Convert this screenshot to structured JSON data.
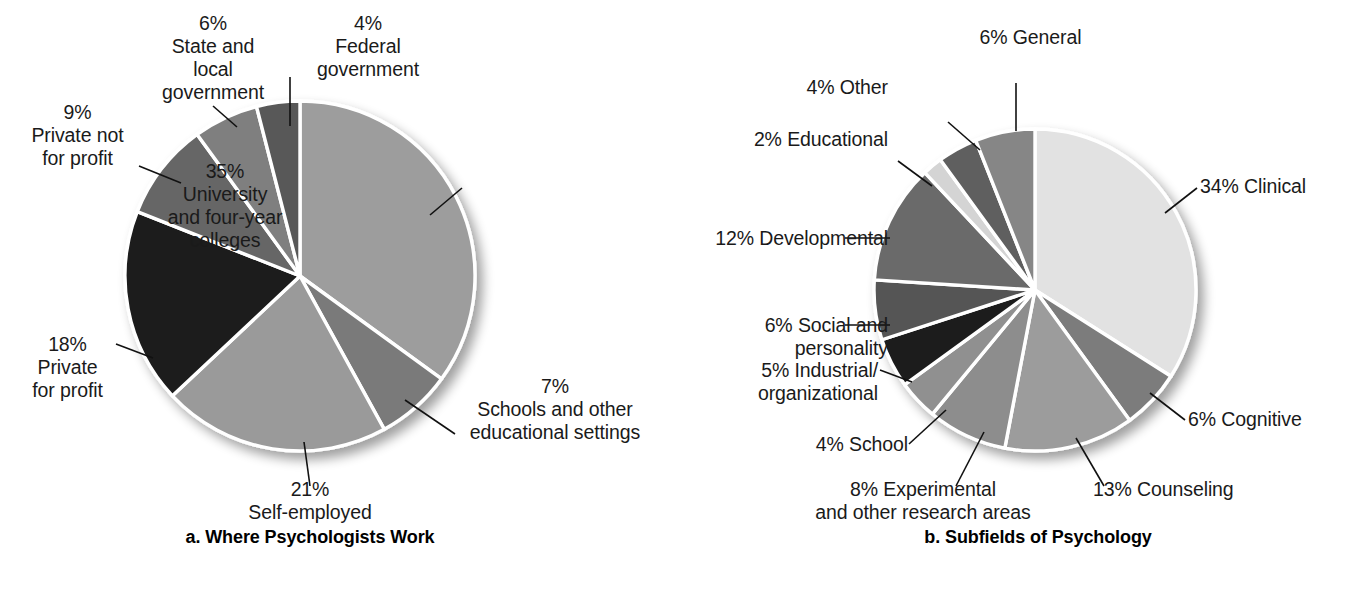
{
  "figure": {
    "panels": [
      {
        "id": "a",
        "caption": "a. Where Psychologists Work",
        "caption_x": 310,
        "caption_y": 537
      },
      {
        "id": "b",
        "caption": "b. Subfields of Psychology",
        "caption_x": 1035,
        "caption_y": 537
      }
    ]
  },
  "chart_data": [
    {
      "type": "pie",
      "title": "a. Where Psychologists Work",
      "legend": "none",
      "start_angle_deg": 0,
      "direction": "clockwise",
      "center": [
        300,
        276
      ],
      "radius": 175,
      "categories": [
        "University and four-year colleges",
        "Schools and other educational settings",
        "Self-employed",
        "Private for profit",
        "Private not for profit",
        "State and local government",
        "Federal government"
      ],
      "values": [
        35,
        7,
        21,
        18,
        9,
        6,
        4
      ],
      "unit": "%",
      "colors": [
        "#9d9d9d",
        "#7a7a7a",
        "#9a9a9a",
        "#1c1c1c",
        "#666666",
        "#7f7f7f",
        "#595959"
      ],
      "slices": [
        {
          "label_pct": "35%",
          "label_lines": [
            "35%",
            "University",
            "and four-year",
            "colleges"
          ],
          "value": 35,
          "color": "#9d9d9d",
          "leader": {
            "x1": 430,
            "y1": 215,
            "x2": 462,
            "y2": 188
          }
        },
        {
          "label_pct": "7%",
          "label_lines": [
            "7%",
            "Schools and other",
            "educational settings"
          ],
          "value": 7,
          "color": "#7a7a7a",
          "leader": {
            "x1": 405,
            "y1": 400,
            "x2": 455,
            "y2": 434
          }
        },
        {
          "label_pct": "21%",
          "label_lines": [
            "21%",
            "Self-employed"
          ],
          "value": 21,
          "color": "#9a9a9a",
          "leader": {
            "x1": 304,
            "y1": 442,
            "x2": 310,
            "y2": 486
          }
        },
        {
          "label_pct": "18%",
          "label_lines": [
            "18%",
            "Private",
            "for profit"
          ],
          "value": 18,
          "color": "#1c1c1c",
          "leader": {
            "x1": 153,
            "y1": 358,
            "x2": 116,
            "y2": 344
          }
        },
        {
          "label_pct": "9%",
          "label_lines": [
            "9%",
            "Private not",
            "for profit"
          ],
          "value": 9,
          "color": "#666666",
          "leader": {
            "x1": 181,
            "y1": 183,
            "x2": 139,
            "y2": 166
          }
        },
        {
          "label_pct": "6%",
          "label_lines": [
            "6%",
            "State and",
            "local",
            "government"
          ],
          "value": 6,
          "color": "#7f7f7f",
          "leader": {
            "x1": 237,
            "y1": 127,
            "x2": 213,
            "y2": 106
          }
        },
        {
          "label_pct": "4%",
          "label_lines": [
            "4%",
            "Federal",
            "government"
          ],
          "value": 4,
          "color": "#595959",
          "leader": {
            "x1": 290,
            "y1": 126,
            "x2": 290,
            "y2": 77
          }
        }
      ]
    },
    {
      "type": "pie",
      "title": "b. Subfields of Psychology",
      "legend": "none",
      "start_angle_deg": 0,
      "direction": "clockwise",
      "center": [
        1035,
        290
      ],
      "radius": 161,
      "categories": [
        "Clinical",
        "Cognitive",
        "Counseling",
        "Experimental and other research areas",
        "School",
        "Industrial/organizational",
        "Social and personality",
        "Developmental",
        "Educational",
        "Other",
        "General"
      ],
      "values": [
        34,
        6,
        13,
        8,
        4,
        5,
        6,
        12,
        2,
        4,
        6
      ],
      "unit": "%",
      "colors": [
        "#e2e2e2",
        "#7c7c7c",
        "#9c9c9c",
        "#8d8d8d",
        "#909090",
        "#1e1e1e",
        "#555555",
        "#6b6b6b",
        "#d4d4d4",
        "#5f5f5f",
        "#868686"
      ],
      "slices": [
        {
          "label_pct": "34%",
          "label_lines": [
            "34% Clinical"
          ],
          "value": 34,
          "color": "#e2e2e2",
          "leader": {
            "x1": 1165,
            "y1": 213,
            "x2": 1197,
            "y2": 188
          }
        },
        {
          "label_pct": "6%",
          "label_lines": [
            "6% Cognitive"
          ],
          "value": 6,
          "color": "#7c7c7c",
          "leader": {
            "x1": 1150,
            "y1": 393,
            "x2": 1185,
            "y2": 420
          }
        },
        {
          "label_pct": "13%",
          "label_lines": [
            "13% Counseling"
          ],
          "value": 13,
          "color": "#9c9c9c",
          "leader": {
            "x1": 1076,
            "y1": 438,
            "x2": 1104,
            "y2": 486
          }
        },
        {
          "label_pct": "8%",
          "label_lines": [
            "8% Experimental",
            "and other research areas"
          ],
          "value": 8,
          "color": "#8d8d8d",
          "leader": {
            "x1": 984,
            "y1": 432,
            "x2": 956,
            "y2": 486
          }
        },
        {
          "label_pct": "4%",
          "label_lines": [
            "4% School"
          ],
          "value": 4,
          "color": "#909090",
          "leader": {
            "x1": 946,
            "y1": 410,
            "x2": 909,
            "y2": 444
          }
        },
        {
          "label_pct": "5%",
          "label_lines": [
            "5% Industrial/",
            "organizational"
          ],
          "value": 5,
          "color": "#1e1e1e",
          "leader": {
            "x1": 912,
            "y1": 382,
            "x2": 880,
            "y2": 370
          }
        },
        {
          "label_pct": "6%",
          "label_lines": [
            "6% Social and",
            "personality"
          ],
          "value": 6,
          "color": "#555555",
          "leader": {
            "x1": 890,
            "y1": 325,
            "x2": 845,
            "y2": 325
          }
        },
        {
          "label_pct": "12%",
          "label_lines": [
            "12% Developmental"
          ],
          "value": 12,
          "color": "#6b6b6b",
          "leader": {
            "x1": 890,
            "y1": 238,
            "x2": 845,
            "y2": 238
          }
        },
        {
          "label_pct": "2%",
          "label_lines": [
            "2% Educational"
          ],
          "value": 2,
          "color": "#d4d4d4",
          "leader": {
            "x1": 932,
            "y1": 186,
            "x2": 898,
            "y2": 161
          }
        },
        {
          "label_pct": "4%",
          "label_lines": [
            "4% Other"
          ],
          "value": 4,
          "color": "#5f5f5f",
          "leader": {
            "x1": 980,
            "y1": 150,
            "x2": 948,
            "y2": 122
          }
        },
        {
          "label_pct": "6%",
          "label_lines": [
            "6% General"
          ],
          "value": 6,
          "color": "#868686",
          "leader": {
            "x1": 1016,
            "y1": 131,
            "x2": 1016,
            "y2": 83
          }
        }
      ]
    }
  ],
  "labels_a": {
    "university": "35%\nUniversity\nand four-year\ncolleges",
    "schools": "7%\nSchools and other\neducational settings",
    "self_employed": "21%\nSelf-employed",
    "private_for_profit": "18%\nPrivate\nfor profit",
    "private_not_for_profit": "9%\nPrivate not\nfor profit",
    "state_local": "6%\nState and\nlocal\ngovernment",
    "federal": "4%\nFederal\ngovernment"
  },
  "labels_b": {
    "clinical": "34% Clinical",
    "cognitive": "6% Cognitive",
    "counseling": "13% Counseling",
    "experimental": "8% Experimental\nand other research areas",
    "school": "4% School",
    "industrial": "5% Industrial/\norganizational",
    "social": "6% Social and\npersonality",
    "developmental": "12% Developmental",
    "educational": "2% Educational",
    "other": "4% Other",
    "general": "6% General"
  },
  "captions": {
    "a": "a. Where Psychologists Work",
    "b": "b. Subfields of Psychology"
  },
  "colors": {
    "background": "#ffffff",
    "text": "#1a1a1a",
    "slice_divider": "#ffffff",
    "shadow": "#cfcfcf"
  }
}
